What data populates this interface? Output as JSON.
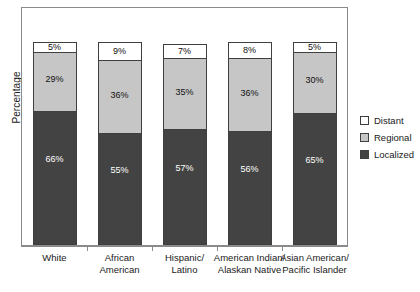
{
  "chart_data": {
    "type": "bar",
    "stacked": true,
    "title": "",
    "xlabel": "",
    "ylabel": "Percentage",
    "ylim": [
      0,
      100
    ],
    "grid": false,
    "legend_position": "right",
    "categories": [
      "White",
      "African American",
      "Hispanic/ Latino",
      "American Indian/ Alaskan Native",
      "Asian American/ Pacific Islander"
    ],
    "category_lines": [
      [
        "White"
      ],
      [
        "African",
        "American"
      ],
      [
        "Hispanic/",
        "Latino"
      ],
      [
        "American Indian/",
        "Alaskan Native"
      ],
      [
        "Asian American/",
        "Pacific Islander"
      ]
    ],
    "series": [
      {
        "name": "Localized",
        "color": "#434343",
        "values": [
          66,
          55,
          57,
          56,
          65
        ],
        "labels": [
          "66%",
          "55%",
          "57%",
          "56%",
          "65%"
        ]
      },
      {
        "name": "Regional",
        "color": "#c6c6c6",
        "values": [
          29,
          36,
          35,
          36,
          30
        ],
        "labels": [
          "29%",
          "36%",
          "35%",
          "36%",
          "30%"
        ]
      },
      {
        "name": "Distant",
        "color": "#ffffff",
        "values": [
          5,
          9,
          7,
          8,
          5
        ],
        "labels": [
          "5%",
          "9%",
          "7%",
          "8%",
          "5%"
        ]
      }
    ]
  },
  "legend": {
    "entries": [
      {
        "label": "Distant",
        "swatch": "sw-distant"
      },
      {
        "label": "Regional",
        "swatch": "sw-regional"
      },
      {
        "label": "Localized",
        "swatch": "sw-localized"
      }
    ]
  },
  "colors": {
    "localized": "#434343",
    "regional": "#c6c6c6",
    "distant": "#ffffff",
    "axis": "#8a8a8a",
    "text": "#1a1a1a"
  }
}
